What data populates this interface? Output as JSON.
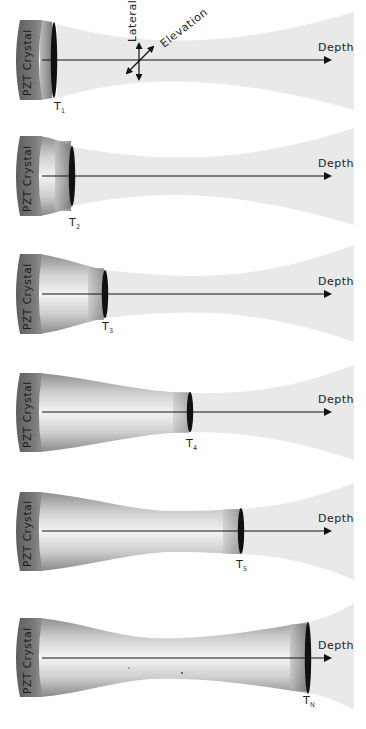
{
  "figure": {
    "colors": {
      "beam_far": "#e9e9e9",
      "crystal_face": "#6f6f6f",
      "focused_body_light": "#e2e2e2",
      "focused_body_dark": "#9a9a9a",
      "lens": "#111111",
      "axis": "#111111"
    },
    "axes": {
      "lateral_label": "Lateral",
      "elevation_label": "Elevation"
    },
    "panels": [
      {
        "crystal_label": "PZT Crystal",
        "depth_label": "Depth",
        "focus_label": "T",
        "focus_sub": "1"
      },
      {
        "crystal_label": "PZT Crystal",
        "depth_label": "Depth",
        "focus_label": "T",
        "focus_sub": "2"
      },
      {
        "crystal_label": "PZT Crystal",
        "depth_label": "Depth",
        "focus_label": "T",
        "focus_sub": "3"
      },
      {
        "crystal_label": "PZT Crystal",
        "depth_label": "Depth",
        "focus_label": "T",
        "focus_sub": "4"
      },
      {
        "crystal_label": "PZT Crystal",
        "depth_label": "Depth",
        "focus_label": "T",
        "focus_sub": "5"
      },
      {
        "crystal_label": "PZT Crystal",
        "depth_label": "Depth",
        "focus_label": "T",
        "focus_sub": "N"
      }
    ]
  }
}
